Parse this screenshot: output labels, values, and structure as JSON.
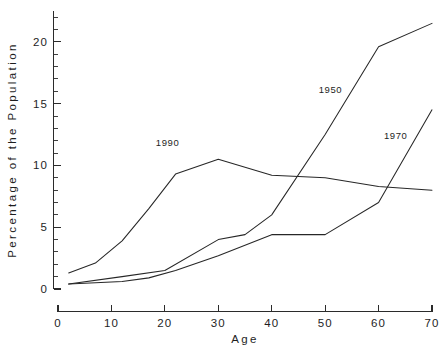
{
  "chart_data": {
    "type": "line",
    "title": "",
    "xlabel": "Age",
    "ylabel": "Percentage of the Population",
    "xlim": [
      0,
      70
    ],
    "ylim": [
      0,
      22.5
    ],
    "grid": false,
    "legend_position": "inline-labels",
    "x_ticks": [
      0,
      10,
      20,
      30,
      40,
      50,
      60,
      70
    ],
    "x_tick_labels": [
      "0",
      "10",
      "20",
      "30",
      "40",
      "50",
      "60",
      "70"
    ],
    "y_ticks": [
      0,
      5,
      10,
      15,
      20
    ],
    "y_tick_labels": [
      "0",
      "5",
      "10",
      "15",
      "20"
    ],
    "y_minor_tick_step": 1,
    "series": [
      {
        "name": "1990",
        "label": "1990",
        "label_x": 20.5,
        "label_y": 11.6,
        "x": [
          2,
          7,
          12,
          17,
          22,
          30,
          40,
          50,
          60,
          70
        ],
        "values": [
          1.3,
          2.1,
          3.9,
          6.5,
          9.3,
          10.5,
          9.2,
          9.0,
          8.3,
          8.0
        ]
      },
      {
        "name": "1950",
        "label": "1950",
        "label_x": 51.0,
        "label_y": 15.9,
        "x": [
          2,
          12,
          20,
          30,
          35,
          40,
          50,
          60,
          70
        ],
        "values": [
          0.4,
          1.0,
          1.5,
          4.0,
          4.4,
          6.0,
          12.5,
          19.6,
          21.5
        ]
      },
      {
        "name": "1970",
        "label": "1970",
        "label_x": 63.2,
        "label_y": 12.1,
        "x": [
          2,
          12,
          17,
          22,
          30,
          40,
          50,
          60,
          70
        ],
        "values": [
          0.4,
          0.6,
          0.9,
          1.5,
          2.7,
          4.4,
          4.4,
          7.0,
          14.5
        ]
      }
    ],
    "colors": {
      "line": "#272727",
      "axis": "#2b2b2b",
      "text": "#1e1e1e",
      "background": "#ffffff"
    }
  },
  "axes": {
    "y_axis_title": "Percentage of the Population",
    "x_axis_title": "Age"
  }
}
